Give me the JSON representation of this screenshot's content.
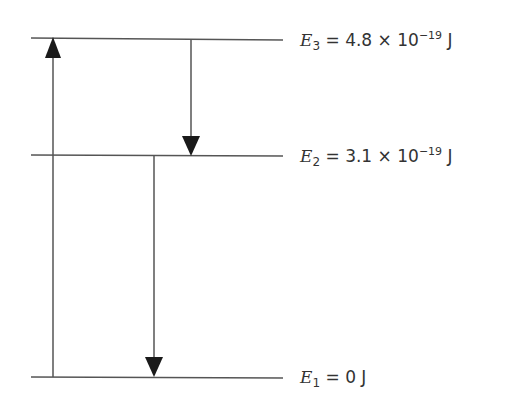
{
  "diagram": {
    "title": "",
    "type": "energy-level-diagram",
    "levels": [
      {
        "id": "E3",
        "symbol": "E",
        "subscript": "3",
        "equals": "=",
        "mantissa": "4.8",
        "times": "×",
        "base": "10",
        "exponent": "−19",
        "unit": "J",
        "y": 39
      },
      {
        "id": "E2",
        "symbol": "E",
        "subscript": "2",
        "equals": "=",
        "mantissa": "3.1",
        "times": "×",
        "base": "10",
        "exponent": "−19",
        "unit": "J",
        "y": 155
      },
      {
        "id": "E1",
        "symbol": "E",
        "subscript": "1",
        "equals": "=",
        "value": "0",
        "unit": "J",
        "y": 377
      }
    ],
    "transitions": [
      {
        "from": "E1",
        "to": "E3",
        "direction": "up",
        "x": 53
      },
      {
        "from": "E3",
        "to": "E2",
        "direction": "down",
        "x": 191
      },
      {
        "from": "E2",
        "to": "E1",
        "direction": "down",
        "x": 154
      }
    ],
    "colors": {
      "line": "#444444",
      "arrowhead": "#1a1a1a",
      "text": "#333333"
    }
  }
}
